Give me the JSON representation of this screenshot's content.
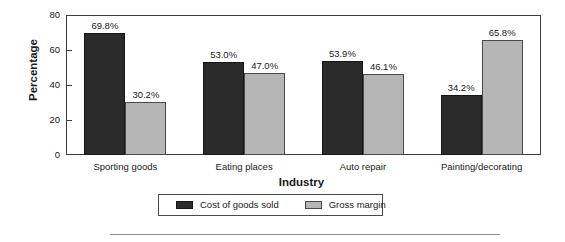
{
  "chart_data": {
    "type": "bar",
    "title": "",
    "xlabel": "Industry",
    "ylabel": "Percentage",
    "categories": [
      "Sporting goods",
      "Eating places",
      "Auto repair",
      "Painting/decorating"
    ],
    "series": [
      {
        "name": "Cost of goods sold",
        "color": "#2b2b2b",
        "values": [
          69.8,
          53.0,
          53.9,
          34.2
        ],
        "labels": [
          "69.8%",
          "53.0%",
          "53.9%",
          "34.2%"
        ]
      },
      {
        "name": "Gross margin",
        "color": "#b6b6b6",
        "values": [
          30.2,
          47.0,
          46.1,
          65.8
        ],
        "labels": [
          "30.2%",
          "47.0%",
          "46.1%",
          "65.8%"
        ]
      }
    ],
    "ylim": [
      0,
      80
    ],
    "yticks": [
      0,
      20,
      40,
      60,
      80
    ],
    "ytick_labels": [
      "0",
      "20",
      "40",
      "60",
      "80"
    ],
    "grid": false,
    "legend_position": "bottom-center",
    "axis_color": "#3d3d3d"
  },
  "axes": {
    "y_title": "Percentage",
    "x_title": "Industry"
  },
  "legend": {
    "items": [
      {
        "label": "Cost of goods sold",
        "swatch": "dark"
      },
      {
        "label": "Gross margin",
        "swatch": "light"
      }
    ]
  }
}
